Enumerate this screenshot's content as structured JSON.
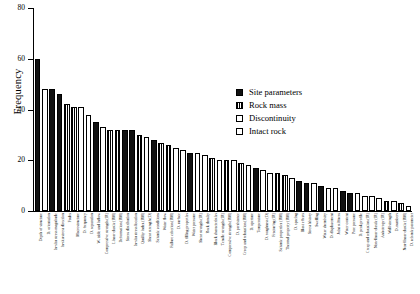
{
  "chart_data": {
    "type": "bar",
    "title": "",
    "xlabel": "",
    "ylabel": "Frequency",
    "ylim": [
      0,
      80
    ],
    "yticks": [
      0,
      20,
      40,
      60,
      80
    ],
    "grid": false,
    "legend_position": "upper-right",
    "legend": [
      {
        "label": "Site parameters",
        "pattern": "solid-black",
        "key": "site"
      },
      {
        "label": "Rock mass",
        "pattern": "vertical-stripes",
        "key": "rock"
      },
      {
        "label": "Discontinuity",
        "pattern": "cross-hatch",
        "key": "disc"
      },
      {
        "label": "Intact rock",
        "pattern": "white-empty",
        "key": "intact"
      }
    ],
    "categories": [
      "Depth of structure",
      "D. orientation",
      "In-situ stress magnitude",
      "In-situ stress direction",
      "Faults",
      "Macrostructure",
      "D. frequency",
      "D. separation",
      "W. table and inflow",
      "Compressive strength (IR)",
      "Linear elastic (RM)",
      "Deformation (RM)",
      "Stress distribution",
      "In-situ stress location",
      "Quality index (RM)",
      "Shear strength (D)",
      "Seismic conditions",
      "Water flow",
      "Failure criterion (RM)",
      "D. surface",
      "D. filling properties",
      "Water pressure",
      "Shear strength (IR)",
      "Rock density",
      "Block characteristics",
      "Tensile strength (IR)",
      "Compressive strength (RM)",
      "D. persistence",
      "Creep and relaxation (RM)",
      "D. aperture",
      "Temperature",
      "D. roughness (D)",
      "Fracturing (IR)",
      "Seismic properties (RM)",
      "Thermal property (RM)",
      "D. spacing",
      "Blast effects",
      "Stress history",
      "Swelling",
      "Water chemistry",
      "D. displacement",
      "Joint stiffness",
      "Water content",
      "Pore pressure",
      "D. peak profile",
      "Creep and relaxation (IR)",
      "Non-linear elastic (IR)",
      "Anisotropy (IR)",
      "Wall strength",
      "D. numbers",
      "Non-linear elastic (RM)",
      "D. seismic parameter"
    ],
    "values": [
      60,
      48,
      48,
      46,
      42,
      41,
      41,
      38,
      35,
      33,
      32,
      32,
      32,
      32,
      30,
      29,
      28,
      27,
      26,
      25,
      24,
      23,
      23,
      22,
      21,
      20,
      20,
      20,
      19,
      18,
      17,
      16,
      15,
      15,
      14,
      13,
      12,
      11,
      11,
      10,
      9,
      9,
      8,
      7,
      7,
      6,
      6,
      5,
      4,
      4,
      3,
      2
    ],
    "groups": [
      "site",
      "disc",
      "site",
      "site",
      "rock",
      "rock",
      "disc",
      "disc",
      "site",
      "intact",
      "rock",
      "rock",
      "site",
      "site",
      "rock",
      "disc",
      "site",
      "rock",
      "rock",
      "disc",
      "disc",
      "site",
      "intact",
      "intact",
      "rock",
      "intact",
      "rock",
      "disc",
      "rock",
      "disc",
      "site",
      "disc",
      "intact",
      "rock",
      "rock",
      "disc",
      "site",
      "site",
      "intact",
      "site",
      "disc",
      "disc",
      "site",
      "site",
      "disc",
      "intact",
      "intact",
      "intact",
      "rock",
      "disc",
      "rock",
      "disc"
    ]
  }
}
